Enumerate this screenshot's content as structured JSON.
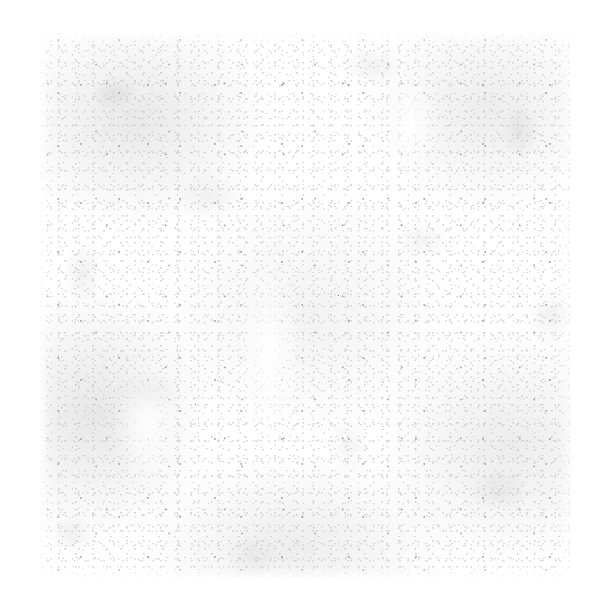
{
  "document": {
    "kind": "scanned-page",
    "condition": "blank-faded",
    "legible_text": "",
    "page_background": "#ffffff",
    "sheet_background": "#ffffff",
    "grain_color_light": "#f4f4f4",
    "grain_color_mid": "#d8d8d8",
    "grain_color_dark": "#9d9d9d",
    "speck_color": "#6e6e6e",
    "sheet": {
      "left": 40,
      "top": 33,
      "width": 533,
      "height": 545
    },
    "canvas": {
      "width": 590,
      "height": 596
    },
    "specks": [
      {
        "x": "56%",
        "y": "48%"
      },
      {
        "x": "29%",
        "y": "68%"
      }
    ],
    "description": "Near-blank scanned sheet with mottled paper grain; no readable characters."
  }
}
